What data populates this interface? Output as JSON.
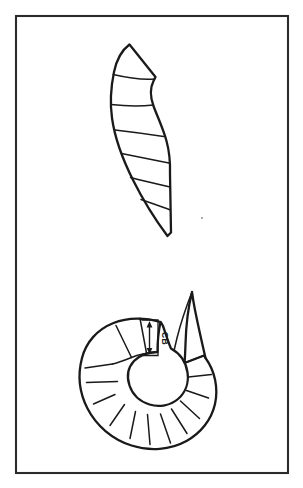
{
  "figure": {
    "background_color": "#ffffff",
    "frame": {
      "name": "figure-border",
      "x": 16,
      "y": 16,
      "width": 272,
      "height": 457,
      "stroke_color": "#2b2b2b",
      "stroke_width": 2.1
    },
    "ink_color": "#1a1a1a",
    "shade_color": "#c8c8c8",
    "panels": [
      {
        "id": "upper",
        "name": "curved-segmented-shell",
        "description": "Elongate gently curved shell divided by transverse septa into chambers, tapering to a point at the lower end",
        "chamber_count": 8,
        "shaded": false
      },
      {
        "id": "lower",
        "name": "coiled-spiral-shell",
        "description": "Planispirally coiled shell with radial septa, alternating shaded and unshaded chambers, central body chamber and a projecting apertural hook",
        "chamber_count": 14,
        "shaded": true
      }
    ],
    "annotation": {
      "name": "cb-measurement",
      "label": "CB",
      "label_rotation_deg": 90,
      "arrow_type": "double-headed-vertical",
      "description": "Measurement of chamber height across one segment of the coiled shell"
    },
    "artifact": {
      "name": "scan-speck",
      "x": 202,
      "y": 218
    }
  }
}
